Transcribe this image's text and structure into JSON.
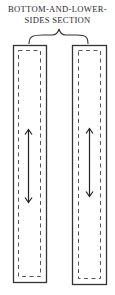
{
  "diagram": {
    "title_line1": "BOTTOM-AND-LOWER-",
    "title_line2": "SIDES SECTION",
    "pieces": [
      {
        "name": "left-piece",
        "grain_arrow": "double-headed vertical"
      },
      {
        "name": "right-piece",
        "grain_arrow": "double-headed vertical"
      }
    ],
    "colors": {
      "line": "#3a3a3a",
      "background": "#ffffff"
    }
  }
}
